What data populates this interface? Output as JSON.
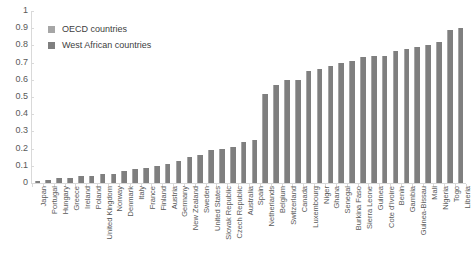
{
  "chart_data": {
    "type": "bar",
    "title": "",
    "xlabel": "",
    "ylabel": "",
    "ylim": [
      0,
      1
    ],
    "ytick_labels": [
      "1",
      "0.9",
      "0.8",
      "0.7",
      "0.6",
      "0.5",
      "0.4",
      "0.3",
      "0.2",
      "0.1",
      "0"
    ],
    "ytick_values": [
      1,
      0.9,
      0.8,
      0.7,
      0.6,
      0.5,
      0.4,
      0.3,
      0.2,
      0.1,
      0
    ],
    "grid": false,
    "legend_position": "top-left",
    "legend": [
      {
        "name": "OECD countries",
        "color": "#a6a6a6"
      },
      {
        "name": "West African countries",
        "color": "#7f7f7f"
      }
    ],
    "bar_color": "#7f7f7f",
    "categories": [
      "Japan",
      "Portugal",
      "Hungary",
      "Greece",
      "Ireland",
      "Poland",
      "United Kingdom",
      "Norway",
      "Denmark",
      "Italy",
      "France",
      "Finland",
      "Austria",
      "Germany",
      "New Zealand",
      "Sweden",
      "United States",
      "Slovak Republic",
      "Czech Republic",
      "Australia",
      "Spain",
      "Netherlands",
      "Belgium",
      "Switzerland",
      "Canada",
      "Luxembourg",
      "Niger",
      "Ghana",
      "Senegal",
      "Burkina Faso",
      "Sierra Leone",
      "Guinea",
      "Cote d'Ivoire",
      "Benin",
      "Gambia",
      "Guinea-Bissau",
      "Mali",
      "Nigeria",
      "Togo",
      "Liberia"
    ],
    "values": [
      0.01,
      0.02,
      0.03,
      0.03,
      0.04,
      0.04,
      0.05,
      0.05,
      0.07,
      0.08,
      0.09,
      0.1,
      0.11,
      0.13,
      0.15,
      0.16,
      0.19,
      0.2,
      0.21,
      0.24,
      0.25,
      0.52,
      0.57,
      0.6,
      0.6,
      0.65,
      0.66,
      0.68,
      0.7,
      0.71,
      0.73,
      0.74,
      0.74,
      0.77,
      0.78,
      0.79,
      0.8,
      0.82,
      0.89,
      0.9
    ],
    "groups": [
      "OECD",
      "OECD",
      "OECD",
      "OECD",
      "OECD",
      "OECD",
      "OECD",
      "OECD",
      "OECD",
      "OECD",
      "OECD",
      "OECD",
      "OECD",
      "OECD",
      "OECD",
      "OECD",
      "OECD",
      "OECD",
      "OECD",
      "OECD",
      "OECD",
      "OECD",
      "OECD",
      "OECD",
      "OECD",
      "OECD",
      "West African",
      "West African",
      "West African",
      "West African",
      "West African",
      "West African",
      "West African",
      "West African",
      "West African",
      "West African",
      "West African",
      "West African",
      "West African",
      "West African"
    ]
  }
}
